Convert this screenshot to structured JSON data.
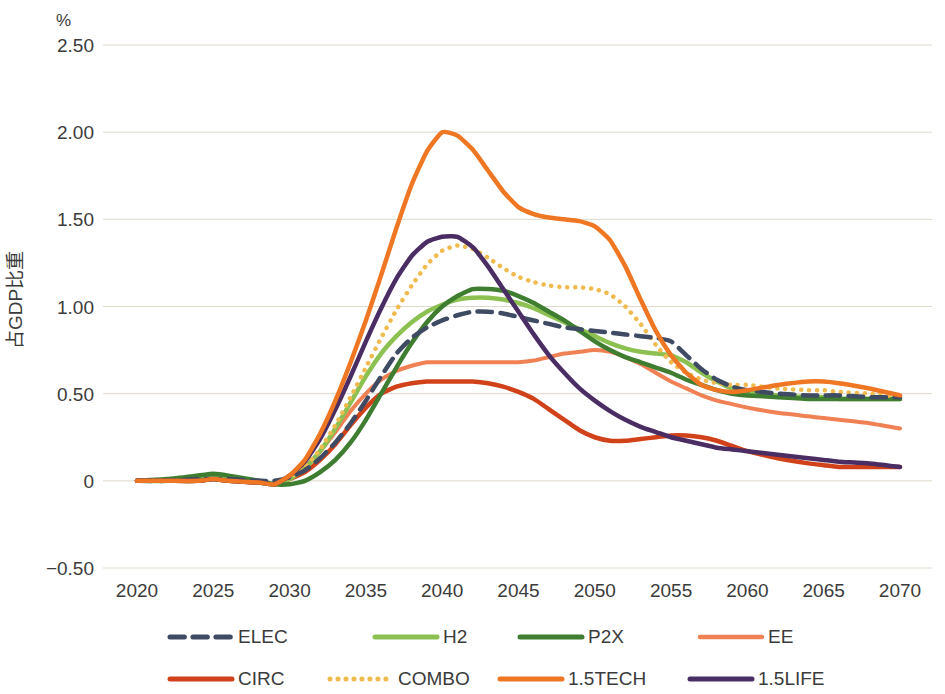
{
  "chart_data": {
    "type": "line",
    "title": "",
    "subtitle": "",
    "unit_label": "%",
    "xlabel": "",
    "ylabel": "占GDP比重",
    "xlim": [
      2020,
      2070
    ],
    "ylim": [
      -0.5,
      2.5
    ],
    "grid": true,
    "grid_axis": "y",
    "legend_position": "bottom",
    "x_ticks": [
      2020,
      2025,
      2030,
      2035,
      2040,
      2045,
      2050,
      2055,
      2060,
      2065,
      2070
    ],
    "x_tick_labels": [
      "2020",
      "2025",
      "2030",
      "2035",
      "2040",
      "2045",
      "2050",
      "2055",
      "2060",
      "2065",
      "2070"
    ],
    "y_ticks": [
      -0.5,
      0,
      0.5,
      1.0,
      1.5,
      2.0,
      2.5
    ],
    "y_tick_labels": [
      "−0.50",
      "0",
      "0.50",
      "1.00",
      "1.50",
      "2.00",
      "2.50"
    ],
    "x": [
      2020,
      2022,
      2024,
      2025,
      2026,
      2028,
      2029,
      2030,
      2031,
      2032,
      2033,
      2034,
      2035,
      2036,
      2037,
      2038,
      2039,
      2040,
      2041,
      2042,
      2043,
      2044,
      2045,
      2046,
      2047,
      2048,
      2049,
      2050,
      2051,
      2052,
      2053,
      2054,
      2055,
      2056,
      2057,
      2058,
      2059,
      2060,
      2062,
      2064,
      2065,
      2066,
      2068,
      2070
    ],
    "series": [
      {
        "name": "ELEC",
        "color": "#3f4a63",
        "style": "dashed",
        "width": 4.5,
        "values": [
          0.0,
          0.0,
          0.01,
          0.01,
          0.01,
          0.0,
          0.0,
          0.02,
          0.06,
          0.13,
          0.22,
          0.33,
          0.46,
          0.6,
          0.73,
          0.82,
          0.88,
          0.92,
          0.95,
          0.97,
          0.97,
          0.96,
          0.94,
          0.92,
          0.9,
          0.88,
          0.87,
          0.86,
          0.85,
          0.84,
          0.83,
          0.82,
          0.8,
          0.72,
          0.64,
          0.58,
          0.54,
          0.52,
          0.5,
          0.49,
          0.49,
          0.49,
          0.48,
          0.48
        ]
      },
      {
        "name": "H2",
        "color": "#8cc152",
        "style": "solid",
        "width": 4.5,
        "values": [
          0.0,
          0.0,
          0.01,
          0.02,
          0.01,
          -0.01,
          -0.02,
          0.01,
          0.07,
          0.17,
          0.3,
          0.45,
          0.6,
          0.73,
          0.83,
          0.91,
          0.97,
          1.01,
          1.04,
          1.05,
          1.05,
          1.04,
          1.02,
          0.99,
          0.95,
          0.91,
          0.87,
          0.83,
          0.79,
          0.76,
          0.74,
          0.73,
          0.72,
          0.68,
          0.62,
          0.57,
          0.53,
          0.51,
          0.49,
          0.48,
          0.48,
          0.47,
          0.47,
          0.47
        ]
      },
      {
        "name": "P2X",
        "color": "#3f7d30",
        "style": "solid",
        "width": 4.5,
        "values": [
          0.0,
          0.01,
          0.03,
          0.04,
          0.03,
          0.0,
          -0.02,
          -0.02,
          0.0,
          0.05,
          0.12,
          0.22,
          0.35,
          0.5,
          0.65,
          0.79,
          0.91,
          1.0,
          1.06,
          1.1,
          1.1,
          1.09,
          1.06,
          1.02,
          0.97,
          0.92,
          0.86,
          0.8,
          0.75,
          0.71,
          0.68,
          0.65,
          0.62,
          0.58,
          0.55,
          0.52,
          0.5,
          0.49,
          0.48,
          0.47,
          0.47,
          0.47,
          0.47,
          0.47
        ]
      },
      {
        "name": "EE",
        "color": "#f08155",
        "style": "solid",
        "width": 4.0,
        "values": [
          0.0,
          0.0,
          0.0,
          0.01,
          0.0,
          -0.01,
          -0.02,
          0.02,
          0.08,
          0.17,
          0.28,
          0.4,
          0.5,
          0.58,
          0.63,
          0.66,
          0.68,
          0.68,
          0.68,
          0.68,
          0.68,
          0.68,
          0.68,
          0.69,
          0.71,
          0.73,
          0.74,
          0.75,
          0.74,
          0.71,
          0.67,
          0.62,
          0.57,
          0.53,
          0.49,
          0.46,
          0.44,
          0.42,
          0.39,
          0.37,
          0.36,
          0.35,
          0.33,
          0.3
        ]
      },
      {
        "name": "CIRC",
        "color": "#d1421a",
        "style": "solid",
        "width": 4.5,
        "values": [
          0.0,
          0.0,
          0.0,
          0.01,
          0.0,
          -0.01,
          -0.02,
          0.01,
          0.05,
          0.12,
          0.21,
          0.32,
          0.42,
          0.5,
          0.54,
          0.56,
          0.57,
          0.57,
          0.57,
          0.57,
          0.56,
          0.54,
          0.51,
          0.47,
          0.41,
          0.35,
          0.29,
          0.25,
          0.23,
          0.23,
          0.24,
          0.25,
          0.26,
          0.26,
          0.25,
          0.23,
          0.2,
          0.17,
          0.13,
          0.1,
          0.09,
          0.08,
          0.08,
          0.08
        ]
      },
      {
        "name": "COMBO",
        "color": "#f0bb4e",
        "style": "dotted",
        "width": 4.5,
        "values": [
          0.0,
          0.0,
          0.0,
          0.01,
          0.0,
          -0.01,
          -0.02,
          0.02,
          0.08,
          0.18,
          0.32,
          0.48,
          0.65,
          0.82,
          0.98,
          1.12,
          1.24,
          1.32,
          1.35,
          1.33,
          1.28,
          1.22,
          1.17,
          1.14,
          1.12,
          1.11,
          1.11,
          1.1,
          1.07,
          1.0,
          0.9,
          0.78,
          0.68,
          0.62,
          0.58,
          0.56,
          0.55,
          0.55,
          0.53,
          0.52,
          0.52,
          0.51,
          0.5,
          0.48
        ]
      },
      {
        "name": "1.5TECH",
        "color": "#ef7723",
        "style": "solid",
        "width": 4.5,
        "values": [
          0.0,
          0.0,
          0.0,
          0.01,
          0.0,
          -0.01,
          -0.02,
          0.03,
          0.12,
          0.27,
          0.46,
          0.68,
          0.92,
          1.18,
          1.45,
          1.7,
          1.89,
          2.0,
          1.98,
          1.9,
          1.78,
          1.66,
          1.57,
          1.53,
          1.51,
          1.5,
          1.49,
          1.46,
          1.38,
          1.23,
          1.04,
          0.86,
          0.72,
          0.62,
          0.55,
          0.52,
          0.51,
          0.52,
          0.55,
          0.57,
          0.57,
          0.56,
          0.53,
          0.49
        ]
      },
      {
        "name": "1.5LIFE",
        "color": "#4a2e63",
        "style": "solid",
        "width": 4.5,
        "values": [
          0.0,
          0.0,
          0.0,
          0.01,
          0.0,
          -0.01,
          -0.02,
          0.03,
          0.11,
          0.24,
          0.41,
          0.6,
          0.8,
          0.99,
          1.16,
          1.29,
          1.37,
          1.4,
          1.4,
          1.34,
          1.23,
          1.1,
          0.97,
          0.84,
          0.72,
          0.62,
          0.53,
          0.46,
          0.4,
          0.35,
          0.31,
          0.28,
          0.25,
          0.23,
          0.21,
          0.19,
          0.18,
          0.17,
          0.15,
          0.13,
          0.12,
          0.11,
          0.1,
          0.08
        ]
      }
    ]
  },
  "legend": {
    "row1": [
      {
        "label": "ELEC"
      },
      {
        "label": "H2"
      },
      {
        "label": "P2X"
      },
      {
        "label": "EE"
      }
    ],
    "row2": [
      {
        "label": "CIRC"
      },
      {
        "label": "COMBO"
      },
      {
        "label": "1.5TECH"
      },
      {
        "label": "1.5LIFE"
      }
    ]
  }
}
